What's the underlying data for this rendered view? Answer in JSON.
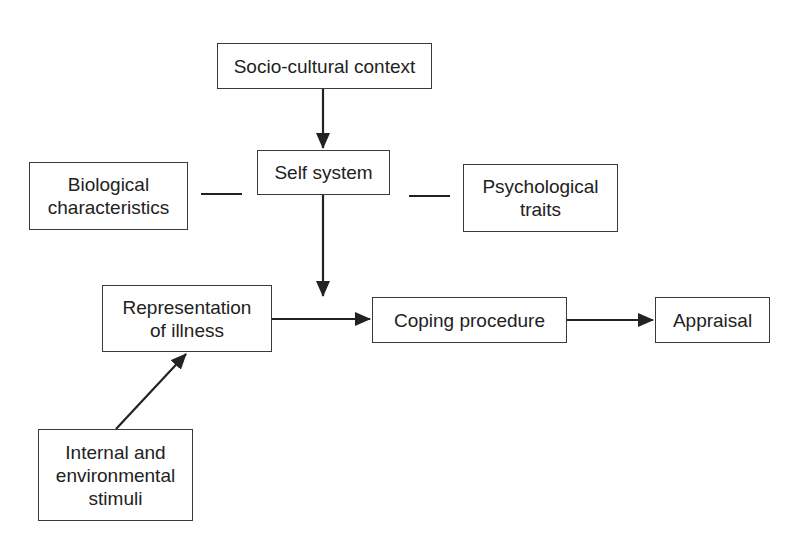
{
  "diagram": {
    "colors": {
      "stroke": "#222222",
      "box_border": "#3a3a3a",
      "text": "#222222",
      "background": "#ffffff"
    },
    "nodes": {
      "socio_cultural": {
        "label": "Socio-cultural context"
      },
      "self_system": {
        "label": "Self system"
      },
      "biological": {
        "line1": "Biological",
        "line2": "characteristics"
      },
      "psychological": {
        "line1": "Psychological",
        "line2": "traits"
      },
      "representation": {
        "line1": "Representation",
        "line2": "of illness"
      },
      "coping": {
        "label": "Coping procedure"
      },
      "appraisal": {
        "label": "Appraisal"
      },
      "stimuli": {
        "line1": "Internal and",
        "line2": "environmental",
        "line3": "stimuli"
      }
    },
    "edges": [
      {
        "from": "Socio-cultural context",
        "to": "Self system",
        "type": "arrow"
      },
      {
        "from": "Biological characteristics",
        "to": "Self system",
        "type": "line"
      },
      {
        "from": "Self system",
        "to": "Psychological traits",
        "type": "line"
      },
      {
        "from": "Self system",
        "to": "Representation/Coping link",
        "type": "arrow"
      },
      {
        "from": "Representation of illness",
        "to": "Coping procedure",
        "type": "arrow"
      },
      {
        "from": "Coping procedure",
        "to": "Appraisal",
        "type": "arrow"
      },
      {
        "from": "Internal and environmental stimuli",
        "to": "Representation of illness",
        "type": "arrow"
      }
    ]
  }
}
